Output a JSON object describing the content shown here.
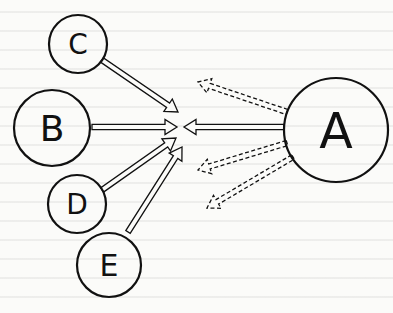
{
  "diagram": {
    "type": "influence-diagram",
    "colors": {
      "stroke": "#111111",
      "background": "#fbfbf9"
    },
    "nodes": [
      {
        "id": "A",
        "label": "A",
        "cx": 336,
        "cy": 130,
        "r": 52
      },
      {
        "id": "B",
        "label": "B",
        "cx": 52,
        "cy": 128,
        "r": 38
      },
      {
        "id": "C",
        "label": "C",
        "cx": 78,
        "cy": 44,
        "r": 29
      },
      {
        "id": "D",
        "label": "D",
        "cx": 77,
        "cy": 204,
        "r": 29
      },
      {
        "id": "E",
        "label": "E",
        "cx": 109,
        "cy": 265,
        "r": 32
      }
    ],
    "convergence_point": {
      "x": 180,
      "y": 127
    },
    "edges": [
      {
        "from": "C",
        "to": "center",
        "style": "solid",
        "x1": 102,
        "y1": 60,
        "x2": 178,
        "y2": 112
      },
      {
        "from": "B",
        "to": "center",
        "style": "solid",
        "x1": 92,
        "y1": 127,
        "x2": 177,
        "y2": 127
      },
      {
        "from": "D",
        "to": "center",
        "style": "solid",
        "x1": 102,
        "y1": 190,
        "x2": 176,
        "y2": 138
      },
      {
        "from": "E",
        "to": "center",
        "style": "solid",
        "x1": 128,
        "y1": 232,
        "x2": 182,
        "y2": 147
      },
      {
        "from": "A",
        "to": "center",
        "style": "solid",
        "x1": 284,
        "y1": 127,
        "x2": 184,
        "y2": 127
      },
      {
        "from": "A",
        "to": "outward-upper-left",
        "style": "dashed",
        "x1": 287,
        "y1": 112,
        "x2": 198,
        "y2": 82
      },
      {
        "from": "A",
        "to": "outward-left",
        "style": "dashed",
        "x1": 287,
        "y1": 143,
        "x2": 198,
        "y2": 170
      },
      {
        "from": "A",
        "to": "outward-lower-left",
        "style": "dashed",
        "x1": 293,
        "y1": 157,
        "x2": 207,
        "y2": 208
      }
    ]
  }
}
